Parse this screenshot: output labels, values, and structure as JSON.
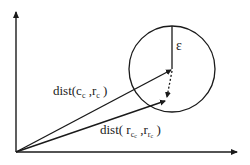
{
  "diagram": {
    "labels": {
      "epsilon": "ε",
      "dist_upper": "dist(c",
      "dist_upper_sub1": "c",
      "dist_upper_mid": " ,r",
      "dist_upper_sub2": "c",
      "dist_upper_end": " )",
      "dist_lower": "dist( r",
      "dist_lower_sub1": "c",
      "dist_lower_sub1_sub": "c",
      "dist_lower_mid": " ,r",
      "dist_lower_sub2": "r",
      "dist_lower_sub2_sub": "c",
      "dist_lower_end": " )"
    },
    "geometry": {
      "origin": [
        16,
        152
      ],
      "circle_center": [
        172,
        69
      ],
      "circle_radius": 43,
      "upper_vector_end": [
        172,
        69
      ],
      "lower_vector_end": [
        166,
        100
      ]
    },
    "colors": {
      "stroke": "#1a1a1a",
      "background": "#ffffff"
    }
  }
}
